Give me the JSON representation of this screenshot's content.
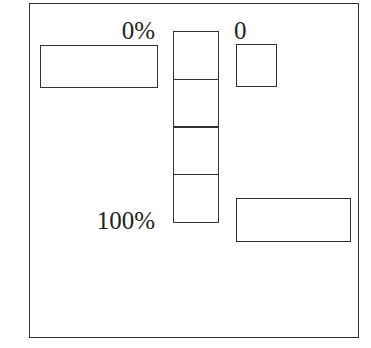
{
  "diagram": {
    "scale": {
      "top_label": "0%",
      "bottom_label": "100%",
      "cell_count": 4
    },
    "right_marker": {
      "label": "0"
    },
    "colors": {
      "stroke": "#333333",
      "background": "#ffffff",
      "text": "#222222"
    }
  }
}
